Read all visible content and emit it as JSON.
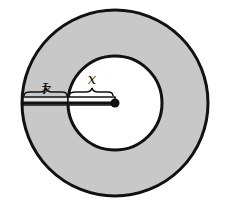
{
  "diagram": {
    "type": "annulus",
    "colors": {
      "ring_fill": "#c8c8c8",
      "inner_fill": "#ffffff",
      "stroke": "#111111"
    },
    "labels": {
      "ring_width": "4",
      "inner_radius": "x"
    }
  }
}
